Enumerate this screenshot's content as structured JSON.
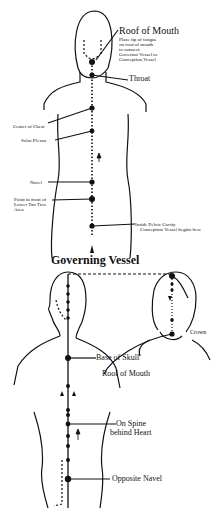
{
  "conception_vessel": {
    "labels": {
      "roof_of_mouth": "Roof of Mouth",
      "roof_note_1": "Place tip of tongue",
      "roof_note_2": "on roof of mouth",
      "roof_note_3": "to connect",
      "roof_note_4": "Governor Vessel to",
      "roof_note_5": "Conception Vessel",
      "throat": "Throat",
      "center_of_chest": "Center of Chest",
      "solar_plexus": "Solar Plexus",
      "navel": "Navel",
      "lower_tan_tien_1": "Point in front of",
      "lower_tan_tien_2": "Lower Tan Tien",
      "lower_tan_tien_3": "Area",
      "pelvic_1": "Inside Pelvic Cavity",
      "pelvic_2": "Conception Vessel begins here"
    }
  },
  "governing_vessel": {
    "title": "Governing Vessel",
    "labels": {
      "crown": "Crown",
      "base_of_skull": "Base of Skull",
      "roof_of_mouth": "Roof of Mouth",
      "spine_heart_1": "On Spine",
      "spine_heart_2": "behind Heart",
      "opposite_navel": "Opposite Navel"
    }
  }
}
